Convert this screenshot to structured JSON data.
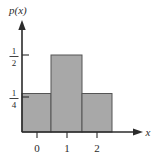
{
  "figure": {
    "title": "",
    "y_axis_label": "p(x)",
    "x_axis_label": "x",
    "fill_color": "#a8a8a8",
    "edge_color": "#555555",
    "axis_color": "#2b2b2b",
    "background_color": "#ffffff",
    "y_ticks": [
      {
        "value": 0.5,
        "numerator": "1",
        "denominator": "2"
      },
      {
        "value": 0.25,
        "numerator": "1",
        "denominator": "4"
      }
    ],
    "x_ticks": [
      {
        "value": 0,
        "label": "0"
      },
      {
        "value": 1,
        "label": "1"
      },
      {
        "value": 2,
        "label": "2"
      }
    ]
  },
  "chart_data": {
    "type": "bar",
    "title": "",
    "xlabel": "x",
    "ylabel": "p(x)",
    "categories": [
      "0",
      "1",
      "2"
    ],
    "values": [
      0.25,
      0.5,
      0.25
    ],
    "value_labels": [
      "1/4",
      "1/2",
      "1/4"
    ],
    "bar_edges": [
      -0.5,
      0.5,
      1.5,
      2.5
    ],
    "bar_width": 1,
    "xlim": [
      -0.75,
      3.0
    ],
    "ylim": [
      0,
      0.68
    ],
    "grid": false,
    "legend": "none",
    "ytick_labels": [
      "1/4",
      "1/2"
    ],
    "ytick_values": [
      0.25,
      0.5
    ],
    "xtick_labels": [
      "0",
      "1",
      "2"
    ],
    "xtick_values": [
      0,
      1,
      2
    ]
  }
}
